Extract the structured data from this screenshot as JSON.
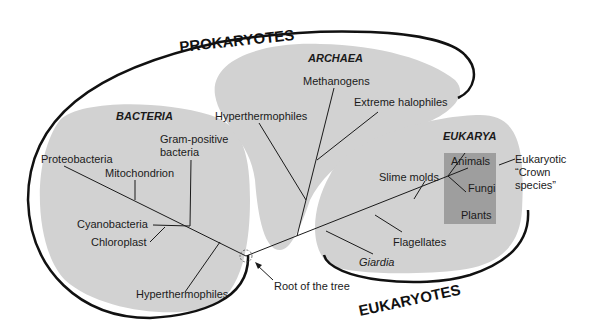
{
  "super_groups": {
    "prokaryotes": "PROKARYOTES",
    "eukaryotes": "EUKARYOTES"
  },
  "domains": {
    "bacteria": "BACTERIA",
    "archaea": "ARCHAEA",
    "eukarya": "EUKARYA"
  },
  "bacteria_taxa": {
    "proteobacteria": "Proteobacteria",
    "mitochondrion": "Mitochondrion",
    "gram_positive_line1": "Gram-positive",
    "gram_positive_line2": "bacteria",
    "cyanobacteria": "Cyanobacteria",
    "chloroplast": "Chloroplast",
    "hyperthermophiles": "Hyperthermophiles"
  },
  "archaea_taxa": {
    "methanogens": "Methanogens",
    "extreme_halophiles": "Extreme halophiles",
    "hyperthermophiles": "Hyperthermophiles"
  },
  "eukarya_taxa": {
    "slime_molds": "Slime molds",
    "flagellates": "Flagellates",
    "giardia": "Giardia",
    "animals": "Animals",
    "fungi": "Fungi",
    "plants": "Plants"
  },
  "annotations": {
    "crown_line1": "Eukaryotic",
    "crown_line2": "“Crown",
    "crown_line3": "species”",
    "root": "Root of the tree"
  },
  "colors": {
    "region_fill": "#d2d2d2",
    "crown_box": "#9e9e9e",
    "line": "#1a1a1a",
    "background": "#ffffff"
  }
}
